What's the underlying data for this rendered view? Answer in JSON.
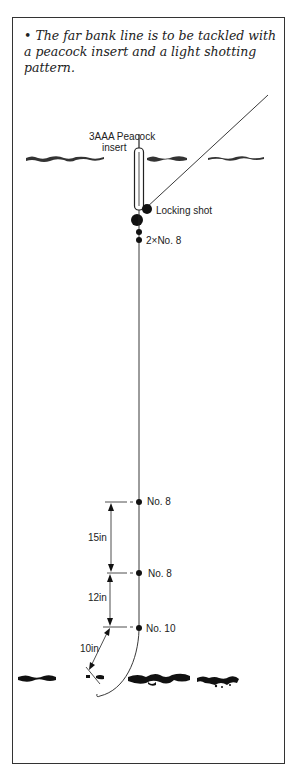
{
  "caption": {
    "bullet": "•",
    "text": "The far bank line is to be tackled with a peacock insert and a light shotting pattern."
  },
  "labels": {
    "float": [
      "3AAA Peacock",
      "insert"
    ],
    "locking_shot": "Locking shot",
    "bulk_shot": "2×No. 8",
    "dropper_1": "No. 8",
    "dropper_2": "No. 8",
    "tell_tale": "No. 10",
    "spacing_1": "15in",
    "spacing_2": "12in",
    "hooklength": "10in"
  },
  "colors": {
    "ink": "#222222",
    "frame": "#333333",
    "background": "#ffffff"
  }
}
